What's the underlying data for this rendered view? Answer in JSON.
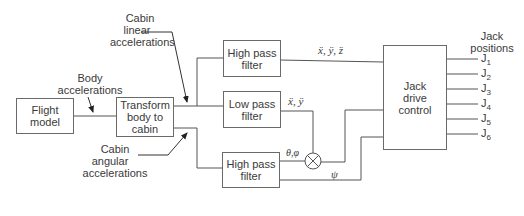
{
  "diagram": {
    "blocks": {
      "flight_model": "Flight\nmodel",
      "transform": "Transform\nbody to\ncabin",
      "high_pass_top": "High pass\nfilter",
      "low_pass": "Low pass\nfilter",
      "high_pass_bottom": "High pass\nfilter",
      "jack_drive": "Jack\ndrive\ncontrol"
    },
    "annotations": {
      "body_accel_1": "Body",
      "body_accel_2": "accelerations",
      "cabin_linear_1": "Cabin",
      "cabin_linear_2": "linear",
      "cabin_linear_3": "accelerations",
      "cabin_angular_1": "Cabin",
      "cabin_angular_2": "angular",
      "cabin_angular_3": "accelerations",
      "jack_positions_1": "Jack",
      "jack_positions_2": "positions"
    },
    "signals": {
      "xyz": "ẍ, ÿ, z̈",
      "xy": "ẍ, ÿ",
      "theta_phi": "θ,φ",
      "psi": "ψ"
    },
    "outputs": [
      {
        "base": "J",
        "sub": "1"
      },
      {
        "base": "J",
        "sub": "2"
      },
      {
        "base": "J",
        "sub": "3"
      },
      {
        "base": "J",
        "sub": "4"
      },
      {
        "base": "J",
        "sub": "5"
      },
      {
        "base": "J",
        "sub": "6"
      }
    ],
    "colors": {
      "line": "#555555",
      "text": "#3a3a3a",
      "background": "#ffffff"
    }
  }
}
